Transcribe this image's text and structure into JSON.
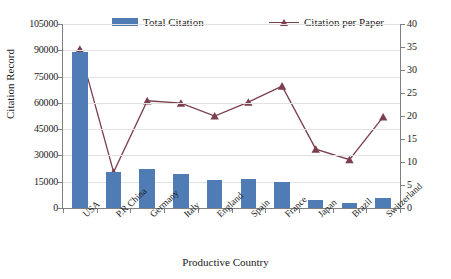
{
  "chart_data": {
    "type": "bar",
    "title": "",
    "xlabel": "Productive Country",
    "ylabel": "Citation Record",
    "y2label": "",
    "categories": [
      "USA",
      "P.R China",
      "Germany",
      "Italy",
      "England",
      "Spain",
      "France",
      "Japan",
      "Brazil",
      "Switzerland"
    ],
    "series": [
      {
        "name": "Total Citation",
        "type": "bar",
        "axis": "left",
        "color": "#4f7cb5",
        "values": [
          89000,
          20500,
          22500,
          19500,
          15800,
          16600,
          14700,
          4700,
          3100,
          5500
        ]
      },
      {
        "name": "Citation per Paper",
        "type": "line",
        "axis": "right",
        "color": "#7b3f4e",
        "marker": "triangle",
        "values": [
          34.5,
          7.8,
          23.3,
          22.8,
          20.0,
          23.0,
          26.5,
          12.8,
          10.5,
          19.8
        ]
      }
    ],
    "ylim": [
      0,
      105000
    ],
    "yticks": [
      "0",
      "15000",
      "30000",
      "45000",
      "60000",
      "75000",
      "90000",
      "105000"
    ],
    "y2lim": [
      0,
      40
    ],
    "y2ticks": [
      "0",
      "5",
      "10",
      "15",
      "20",
      "25",
      "30",
      "35",
      "40"
    ],
    "grid": true,
    "legend_position": "top"
  },
  "legend": {
    "bar_label": "Total Citation",
    "line_label": "Citation per Paper"
  }
}
